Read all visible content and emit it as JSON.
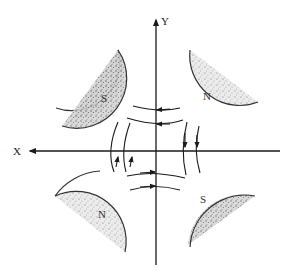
{
  "diagram": {
    "axes": {
      "x_label": "X",
      "y_label": "Y"
    },
    "poles": [
      {
        "position": "top-left",
        "label": "S"
      },
      {
        "position": "top-right",
        "label": "N"
      },
      {
        "position": "bottom-left",
        "label": "N"
      },
      {
        "position": "bottom-right",
        "label": "S"
      }
    ],
    "colors": {
      "line": "#1a1a1a",
      "magnet_fill": "#d8d8d8",
      "background": "#ffffff"
    }
  }
}
